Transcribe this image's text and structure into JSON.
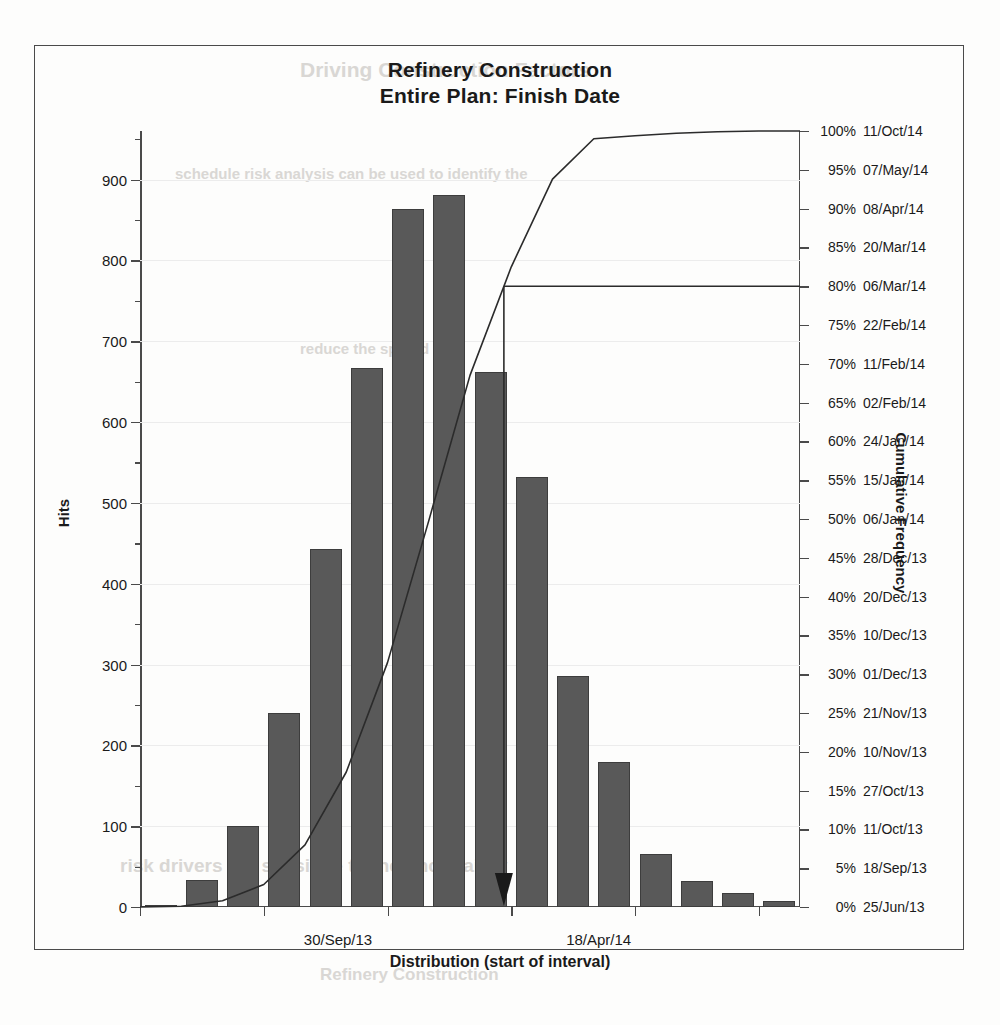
{
  "chart_data": {
    "type": "bar",
    "title": "Refinery Construction\nEntire Plan: Finish Date",
    "title_line1": "Refinery Construction",
    "title_line2": "Entire Plan: Finish Date",
    "xlabel": "Distribution (start of interval)",
    "ylabel": "Hits",
    "y2label": "Cumulative Frequency",
    "ylim": [
      0,
      960
    ],
    "yticks": [
      0,
      100,
      200,
      300,
      400,
      500,
      600,
      700,
      800,
      900
    ],
    "ytick_labels": [
      "0",
      "100",
      "200",
      "300",
      "400",
      "500",
      "600",
      "700",
      "800",
      "900"
    ],
    "grid": true,
    "categories": [
      "25/Jun/13",
      "03/Aug/13",
      "11/Sep/13",
      "30/Sep/13",
      "19/Oct/13",
      "07/Nov/13",
      "26/Nov/13",
      "15/Dec/13",
      "03/Jan/14",
      "22/Jan/14",
      "10/Feb/14",
      "01/Mar/14",
      "20/Mar/14",
      "08/Apr/14",
      "27/Apr/14",
      "16/May/14"
    ],
    "values": [
      3,
      33,
      100,
      240,
      443,
      667,
      863,
      881,
      662,
      532,
      286,
      179,
      65,
      32,
      17,
      8
    ],
    "series": [
      {
        "name": "Hits",
        "type": "bar",
        "values": [
          3,
          33,
          100,
          240,
          443,
          667,
          863,
          881,
          662,
          532,
          286,
          179,
          65,
          32,
          17,
          8
        ]
      },
      {
        "name": "Cumulative Frequency",
        "type": "line",
        "axis": "right",
        "values_pct": [
          0.1,
          0.8,
          2.9,
          8.0,
          17.4,
          31.5,
          49.8,
          68.5,
          82.5,
          93.8,
          99.0,
          99.4,
          99.7,
          99.9,
          100.0,
          100.0
        ]
      }
    ],
    "xtick_labels": [
      "30/Sep/13",
      "18/Apr/14"
    ],
    "xtick_positions_pct": [
      30.0,
      69.5
    ],
    "y2_axis_labels": [
      {
        "pct": "100%",
        "date": "11/Oct/14"
      },
      {
        "pct": "95%",
        "date": "07/May/14"
      },
      {
        "pct": "90%",
        "date": "08/Apr/14"
      },
      {
        "pct": "85%",
        "date": "20/Mar/14"
      },
      {
        "pct": "80%",
        "date": "06/Mar/14"
      },
      {
        "pct": "75%",
        "date": "22/Feb/14"
      },
      {
        "pct": "70%",
        "date": "11/Feb/14"
      },
      {
        "pct": "65%",
        "date": "02/Feb/14"
      },
      {
        "pct": "60%",
        "date": "24/Jan/14"
      },
      {
        "pct": "55%",
        "date": "15/Jan/14"
      },
      {
        "pct": "50%",
        "date": "06/Jan/14"
      },
      {
        "pct": "45%",
        "date": "28/Dec/13"
      },
      {
        "pct": "40%",
        "date": "20/Dec/13"
      },
      {
        "pct": "35%",
        "date": "10/Dec/13"
      },
      {
        "pct": "30%",
        "date": "01/Dec/13"
      },
      {
        "pct": "25%",
        "date": "21/Nov/13"
      },
      {
        "pct": "20%",
        "date": "10/Nov/13"
      },
      {
        "pct": "15%",
        "date": "27/Oct/13"
      },
      {
        "pct": "10%",
        "date": "11/Oct/13"
      },
      {
        "pct": "5%",
        "date": "18/Sep/13"
      },
      {
        "pct": "0%",
        "date": "25/Jun/13"
      }
    ],
    "annotations": [
      {
        "name": "p80-marker",
        "level_pct": 80,
        "date": "06/Mar/14",
        "description": "Horizontal reference line at 80% cumulative frequency with vertical drop-line and downward arrow at the x-axis"
      }
    ],
    "colors": {
      "bar_fill": "#595959",
      "bar_edge": "#3d3d3d",
      "curve": "#2b2b2b",
      "axis": "#4a4a4a",
      "grid": "#ececec",
      "background": "#fdfdfc"
    }
  },
  "ghost_text": {
    "g1": "Driving Construction Factors",
    "g2": "schedule risk analysis can be used to identify the",
    "g3": "reduce the spread",
    "g4": "risk drivers are sensitive to the uncertainty",
    "g5": "Refinery Construction"
  }
}
